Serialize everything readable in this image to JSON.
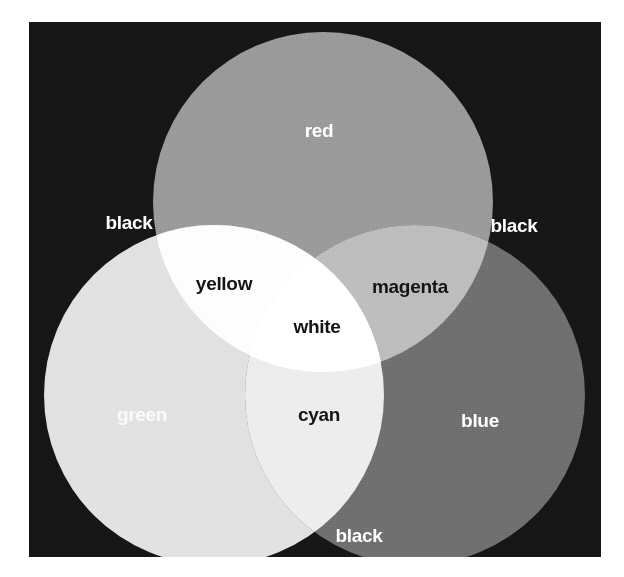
{
  "figure": {
    "background_color": "#161616",
    "plate": {
      "x": 29,
      "y": 22,
      "width": 572,
      "height": 535
    }
  },
  "circles": [
    {
      "id": "red",
      "label": "red",
      "fill": "#9a9a9a",
      "cx": 294,
      "cy": 180,
      "r": 170
    },
    {
      "id": "green",
      "label": "green",
      "fill": "#e2e2e2",
      "cx": 185,
      "cy": 373,
      "r": 170
    },
    {
      "id": "blue",
      "label": "blue",
      "fill": "#6f6f6f",
      "cx": 386,
      "cy": 373,
      "r": 170
    }
  ],
  "regions": [
    {
      "id": "red",
      "label": "red",
      "fill": "#9a9a9a",
      "text_color": "#ffffff",
      "members": [
        "red"
      ]
    },
    {
      "id": "green",
      "label": "green",
      "fill": "#e2e2e2",
      "text_color": "#fbfbfb",
      "members": [
        "green"
      ]
    },
    {
      "id": "blue",
      "label": "blue",
      "fill": "#6f6f6f",
      "text_color": "#ffffff",
      "members": [
        "blue"
      ]
    },
    {
      "id": "yellow",
      "label": "yellow",
      "fill": "#fdfdfd",
      "text_color": "#141414",
      "members": [
        "red",
        "green"
      ]
    },
    {
      "id": "magenta",
      "label": "magenta",
      "fill": "#bdbdbd",
      "text_color": "#141414",
      "members": [
        "red",
        "blue"
      ]
    },
    {
      "id": "cyan",
      "label": "cyan",
      "fill": "#ededed",
      "text_color": "#141414",
      "members": [
        "green",
        "blue"
      ]
    },
    {
      "id": "white",
      "label": "white",
      "fill": "#ffffff",
      "text_color": "#141414",
      "members": [
        "red",
        "green",
        "blue"
      ]
    },
    {
      "id": "black-top-left",
      "label": "black",
      "fill": "#161616",
      "text_color": "#ffffff",
      "members": []
    },
    {
      "id": "black-top-right",
      "label": "black",
      "fill": "#161616",
      "text_color": "#ffffff",
      "members": []
    },
    {
      "id": "black-bottom",
      "label": "black",
      "fill": "#161616",
      "text_color": "#ffffff",
      "members": []
    }
  ],
  "labels": {
    "red": "red",
    "green": "green",
    "blue": "blue",
    "yellow": "yellow",
    "magenta": "magenta",
    "cyan": "cyan",
    "white": "white",
    "black_top_left": "black",
    "black_top_right": "black",
    "black_bottom": "black"
  }
}
